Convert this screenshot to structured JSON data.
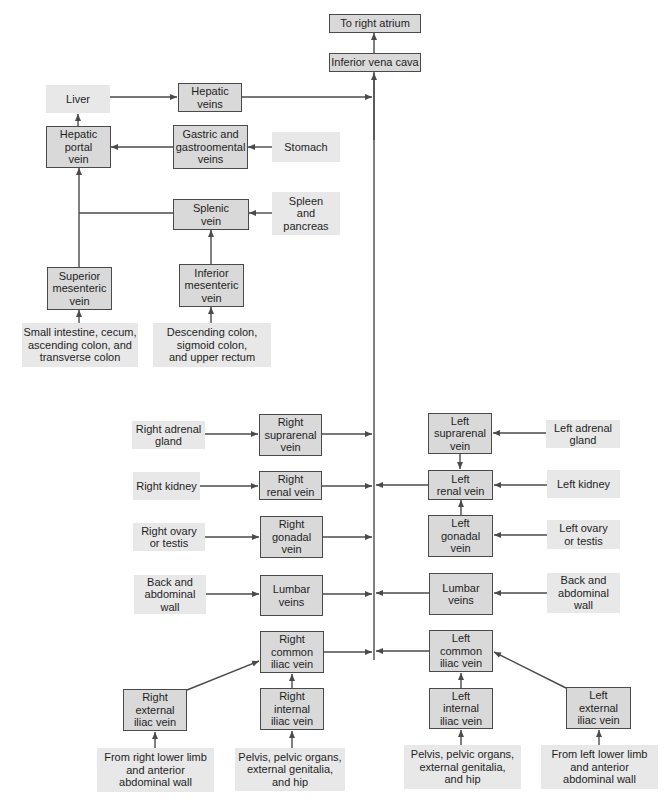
{
  "diagram": {
    "type": "flowchart",
    "colors": {
      "vein_box_fill": "#d9d9d9",
      "vein_box_border": "#4a4a4a",
      "source_box_fill": "#e8e8e8",
      "line": "#4a4a4a"
    },
    "nodes": {
      "right_atrium": "To right atrium",
      "ivc": "Inferior vena cava",
      "liver": "Liver",
      "hepatic_veins": "Hepatic\nveins",
      "hepatic_portal_vein": "Hepatic\nportal\nvein",
      "gastric_veins": "Gastric and\ngastroomental\nveins",
      "stomach": "Stomach",
      "splenic_vein": "Splenic\nvein",
      "spleen_pancreas": "Spleen\nand\npancreas",
      "superior_mesenteric_vein": "Superior\nmesenteric\nvein",
      "inferior_mesenteric_vein": "Inferior\nmesenteric\nvein",
      "small_intestine": "Small intestine, cecum,\nascending colon, and\ntransverse colon",
      "descending_colon": "Descending colon,\nsigmoid colon,\nand upper rectum",
      "right_adrenal_gland": "Right adrenal\ngland",
      "right_suprarenal_vein": "Right\nsuprarenal\nvein",
      "right_kidney": "Right kidney",
      "right_renal_vein": "Right\nrenal vein",
      "right_ovary_testis": "Right ovary\nor testis",
      "right_gonadal_vein": "Right\ngonadal\nvein",
      "right_back_wall": "Back and\nabdominal\nwall",
      "right_lumbar_veins": "Lumbar\nveins",
      "left_suprarenal_vein": "Left\nsuprarenal\nvein",
      "left_adrenal_gland": "Left adrenal\ngland",
      "left_renal_vein": "Left\nrenal vein",
      "left_kidney": "Left kidney",
      "left_gonadal_vein": "Left\ngonadal\nvein",
      "left_ovary_testis": "Left ovary\nor testis",
      "left_lumbar_veins": "Lumbar\nveins",
      "left_back_wall": "Back and\nabdominal\nwall",
      "right_common_iliac_vein": "Right\ncommon\niliac vein",
      "right_internal_iliac_vein": "Right\ninternal\niliac vein",
      "right_external_iliac_vein": "Right\nexternal\niliac vein",
      "right_lower_limb": "From right lower limb\nand anterior\nabdominal wall",
      "right_pelvis": "Pelvis, pelvic organs,\nexternal genitalia,\nand hip",
      "left_common_iliac_vein": "Left\ncommon\niliac vein",
      "left_internal_iliac_vein": "Left\ninternal\niliac vein",
      "left_external_iliac_vein": "Left\nexternal\niliac vein",
      "left_pelvis": "Pelvis, pelvic organs,\nexternal genitalia,\nand hip",
      "left_lower_limb": "From left lower limb\nand anterior\nabdominal wall"
    },
    "edges": [
      [
        "ivc",
        "right_atrium"
      ],
      [
        "liver",
        "hepatic_veins"
      ],
      [
        "hepatic_veins",
        "ivc"
      ],
      [
        "hepatic_portal_vein",
        "liver"
      ],
      [
        "gastric_veins",
        "hepatic_portal_vein"
      ],
      [
        "stomach",
        "gastric_veins"
      ],
      [
        "splenic_vein",
        "hepatic_portal_vein"
      ],
      [
        "spleen_pancreas",
        "splenic_vein"
      ],
      [
        "superior_mesenteric_vein",
        "hepatic_portal_vein"
      ],
      [
        "inferior_mesenteric_vein",
        "splenic_vein"
      ],
      [
        "small_intestine",
        "superior_mesenteric_vein"
      ],
      [
        "descending_colon",
        "inferior_mesenteric_vein"
      ],
      [
        "right_adrenal_gland",
        "right_suprarenal_vein"
      ],
      [
        "right_suprarenal_vein",
        "ivc"
      ],
      [
        "right_kidney",
        "right_renal_vein"
      ],
      [
        "right_renal_vein",
        "ivc"
      ],
      [
        "right_ovary_testis",
        "right_gonadal_vein"
      ],
      [
        "right_gonadal_vein",
        "ivc"
      ],
      [
        "right_back_wall",
        "right_lumbar_veins"
      ],
      [
        "right_lumbar_veins",
        "ivc"
      ],
      [
        "left_adrenal_gland",
        "left_suprarenal_vein"
      ],
      [
        "left_suprarenal_vein",
        "left_renal_vein"
      ],
      [
        "left_kidney",
        "left_renal_vein"
      ],
      [
        "left_renal_vein",
        "ivc"
      ],
      [
        "left_ovary_testis",
        "left_gonadal_vein"
      ],
      [
        "left_gonadal_vein",
        "left_renal_vein"
      ],
      [
        "left_back_wall",
        "left_lumbar_veins"
      ],
      [
        "left_lumbar_veins",
        "ivc"
      ],
      [
        "right_common_iliac_vein",
        "ivc"
      ],
      [
        "right_internal_iliac_vein",
        "right_common_iliac_vein"
      ],
      [
        "right_external_iliac_vein",
        "right_common_iliac_vein"
      ],
      [
        "right_lower_limb",
        "right_external_iliac_vein"
      ],
      [
        "right_pelvis",
        "right_internal_iliac_vein"
      ],
      [
        "left_common_iliac_vein",
        "ivc"
      ],
      [
        "left_internal_iliac_vein",
        "left_common_iliac_vein"
      ],
      [
        "left_external_iliac_vein",
        "left_common_iliac_vein"
      ],
      [
        "left_pelvis",
        "left_internal_iliac_vein"
      ],
      [
        "left_lower_limb",
        "left_external_iliac_vein"
      ]
    ]
  }
}
